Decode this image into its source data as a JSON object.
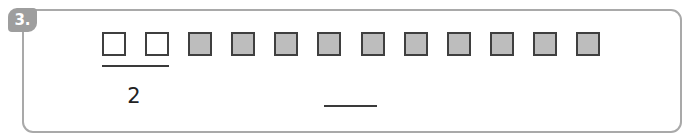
{
  "problem": {
    "number_label": "3.",
    "squares": [
      {
        "fill": "white"
      },
      {
        "fill": "white"
      },
      {
        "fill": "gray"
      },
      {
        "fill": "gray"
      },
      {
        "fill": "gray"
      },
      {
        "fill": "gray"
      },
      {
        "fill": "gray"
      },
      {
        "fill": "gray"
      },
      {
        "fill": "gray"
      },
      {
        "fill": "gray"
      },
      {
        "fill": "gray"
      },
      {
        "fill": "gray"
      }
    ],
    "white_count_label": "2",
    "answer_blank": ""
  },
  "colors": {
    "frame_border": "#a9a9a9",
    "badge_bg": "#9e9e9e",
    "square_border": "#3f3f3f",
    "square_gray": "#bdbdbd",
    "square_white": "#ffffff"
  }
}
